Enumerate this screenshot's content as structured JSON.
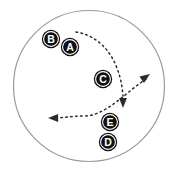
{
  "figure": {
    "canvas": {
      "width": 178,
      "height": 171,
      "background": "#ffffff"
    },
    "boundary": {
      "shape": "circle",
      "cx": 89,
      "cy": 86,
      "r": 75.5,
      "stroke_color": "#9a9a9a",
      "stroke_width": 1.2,
      "fill": "none"
    },
    "marker_style": {
      "disc_color": "#111111",
      "ring_color": "#ffffff",
      "letter_color": "#ffffff",
      "radius": 9.2,
      "ring_radius": 7.4,
      "inner_radius": 6.2
    },
    "markers": [
      {
        "label": "B",
        "cx": 51,
        "cy": 39
      },
      {
        "label": "A",
        "cx": 70,
        "cy": 47
      },
      {
        "label": "C",
        "cx": 103,
        "cy": 79
      },
      {
        "label": "E",
        "cx": 110,
        "cy": 122
      },
      {
        "label": "D",
        "cx": 108,
        "cy": 142
      }
    ],
    "arrows": [
      {
        "name": "arrow-down-from-top",
        "path": "M 76 32 C 101 36, 120 58, 123 96",
        "stroke_color": "#2b2b2b",
        "stroke_width": 1.5,
        "dash": "1.6 3.4",
        "head": {
          "x": 123,
          "y": 108,
          "angle_deg": 90,
          "size": 7.5
        }
      },
      {
        "name": "arrow-left-sweep",
        "path": "M 146 79 C 126 92, 106 116, 84 116 C 70 116, 62 118, 56 118",
        "stroke_color": "#2b2b2b",
        "stroke_width": 1.5,
        "dash": "1.6 3.4",
        "head": {
          "x": 48,
          "y": 118,
          "angle_deg": 180,
          "size": 7.5
        }
      },
      {
        "name": "arrow-up-right",
        "path": "",
        "stroke_color": "#2b2b2b",
        "stroke_width": 1.5,
        "dash": "1.6 3.4",
        "head": {
          "x": 150,
          "y": 74,
          "angle_deg": -35,
          "size": 7.5
        }
      }
    ]
  }
}
